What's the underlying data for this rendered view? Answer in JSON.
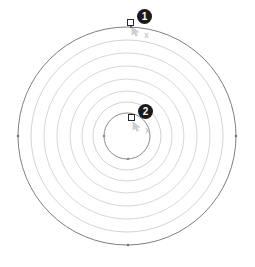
{
  "figure": {
    "background_color": "#ffffff",
    "canvas": {
      "width": 255,
      "height": 267
    },
    "center": {
      "x": 127,
      "y": 136
    },
    "ring_color_outer": "#6b6b6b",
    "ring_color_inner": "#c9c9c9",
    "ring_color_active": "#7a7a7a",
    "rings": [
      {
        "id": "ring-1",
        "radius": 109,
        "stroke": "#6f6f6f",
        "stroke_width": 0.9,
        "label": "outer circle"
      },
      {
        "id": "ring-2",
        "radius": 96,
        "stroke": "#c2c2c2",
        "stroke_width": 0.7,
        "label": "offset circle 2"
      },
      {
        "id": "ring-3",
        "radius": 83,
        "stroke": "#c6c6c6",
        "stroke_width": 0.7,
        "label": "offset circle 3"
      },
      {
        "id": "ring-4",
        "radius": 70,
        "stroke": "#c6c6c6",
        "stroke_width": 0.7,
        "label": "offset circle 4"
      },
      {
        "id": "ring-5",
        "radius": 57,
        "stroke": "#c6c6c6",
        "stroke_width": 0.7,
        "label": "offset circle 5"
      },
      {
        "id": "ring-6",
        "radius": 45,
        "stroke": "#c6c6c6",
        "stroke_width": 0.7,
        "label": "offset circle 6"
      },
      {
        "id": "ring-7",
        "radius": 34,
        "stroke": "#bdbdbd",
        "stroke_width": 0.7,
        "label": "offset circle 7"
      },
      {
        "id": "ring-8",
        "radius": 23,
        "stroke": "#7e7e7e",
        "stroke_width": 0.9,
        "label": "inner circle"
      }
    ],
    "node_markers": [
      {
        "id": "node-left",
        "x": 18,
        "y": 136,
        "color": "#6f6f6f"
      },
      {
        "id": "node-right",
        "x": 236,
        "y": 136,
        "color": "#6f6f6f"
      },
      {
        "id": "node-bottom",
        "x": 128,
        "y": 245,
        "color": "#6f6f6f"
      },
      {
        "id": "node-top",
        "x": 131,
        "y": 27,
        "color": "#6f6f6f"
      },
      {
        "id": "node-inner-left",
        "x": 104,
        "y": 136,
        "color": "#8a8a8a"
      },
      {
        "id": "node-inner-bottom",
        "x": 128,
        "y": 159,
        "color": "#8a8a8a"
      },
      {
        "id": "node-inner-top",
        "x": 131,
        "y": 114,
        "color": "#8a8a8a"
      }
    ]
  },
  "callouts": [
    {
      "id": "callout-1",
      "number": "1",
      "badge": {
        "x": 137,
        "y": 9
      },
      "handle": {
        "x": 127,
        "y": 19
      },
      "cursor": {
        "x": 131,
        "y": 24
      },
      "snap_marker": {
        "x": 142,
        "y": 31,
        "glyph": "x"
      },
      "description": "Drag handle on outer circle"
    },
    {
      "id": "callout-2",
      "number": "2",
      "badge": {
        "x": 138,
        "y": 104
      },
      "handle": {
        "x": 128,
        "y": 114
      },
      "cursor": {
        "x": 132,
        "y": 119
      },
      "snap_marker": {
        "x": 143,
        "y": 126,
        "glyph": "x"
      },
      "description": "Drag handle on inner circle"
    }
  ]
}
